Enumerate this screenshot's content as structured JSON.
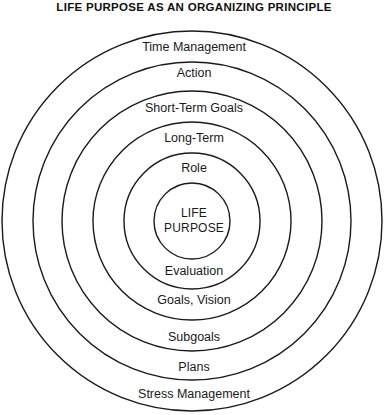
{
  "title": "LIFE PURPOSE AS AN ORGANIZING PRINCIPLE",
  "center": {
    "line1": "LIFE",
    "line2": "PURPOSE"
  },
  "upper_rings": [
    {
      "label": "Time Management",
      "top": 40
    },
    {
      "label": "Action",
      "top": 66
    },
    {
      "label": "Short-Term Goals",
      "top": 101
    },
    {
      "label": "Long-Term",
      "top": 131
    },
    {
      "label": "Role",
      "top": 161
    }
  ],
  "lower_rings": [
    {
      "label": "Evaluation",
      "top": 264
    },
    {
      "label": "Goals, Vision",
      "top": 293
    },
    {
      "label": "Subgoals",
      "top": 330
    },
    {
      "label": "Plans",
      "top": 360
    },
    {
      "label": "Stress Management",
      "top": 387
    }
  ],
  "geometry": {
    "center_x": 192,
    "center_y": 221,
    "radii": [
      190,
      159,
      130,
      99,
      68,
      38
    ],
    "stroke_color": "#1a1a1a",
    "background_color": "#ffffff"
  }
}
